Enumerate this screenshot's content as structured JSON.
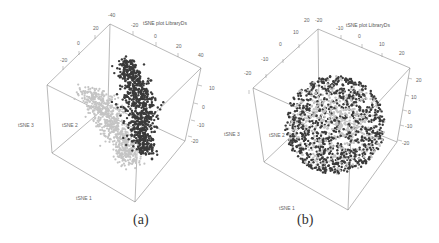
{
  "chart_data": [
    {
      "type": "scatter",
      "subtype": "3d-scatter",
      "panel": "(a)",
      "title": "tSNE plot LibraryDs",
      "axes": {
        "x": {
          "label": "tSNE 1",
          "ticks": []
        },
        "y": {
          "label": "tSNE 2",
          "ticks": []
        },
        "z": {
          "label": "tSNE 3",
          "ticks": [
            "10",
            "0",
            "-10",
            "-20"
          ]
        },
        "top_edge_ticks": [
          "-20",
          "0",
          "20",
          "40"
        ],
        "left_edge_ticks": [
          "-20",
          "0",
          "20",
          "40"
        ]
      },
      "series": [
        {
          "name": "cluster-light",
          "color": "#c4c4c4",
          "description": "elongated curved cluster on left side"
        },
        {
          "name": "cluster-dark",
          "color": "#3a3a3a",
          "description": "tall vertical band cluster on right side"
        }
      ],
      "grid": false,
      "legend": "none"
    },
    {
      "type": "scatter",
      "subtype": "3d-scatter",
      "panel": "(b)",
      "title": "tSNE plot LibraryDs",
      "axes": {
        "x": {
          "label": "tSNE 1",
          "ticks": []
        },
        "y": {
          "label": "tSNE 2",
          "ticks": []
        },
        "z": {
          "label": "tSNE 3",
          "ticks": [
            "20",
            "10",
            "0",
            "-10",
            "-20"
          ]
        },
        "top_edge_ticks": [
          "-20",
          "-10",
          "0",
          "10",
          "20"
        ],
        "left_edge_ticks": [
          "-20",
          "-10",
          "0",
          "10",
          "20"
        ]
      },
      "series": [
        {
          "name": "points-light",
          "color": "#c4c4c4",
          "description": "mixed within a spherical blob"
        },
        {
          "name": "points-dark",
          "color": "#3a3a3a",
          "description": "mixed within a spherical blob"
        }
      ],
      "grid": false,
      "legend": "none"
    }
  ],
  "panels": {
    "a": {
      "caption": "(a)",
      "title": "tSNE plot LibraryDs",
      "label_x": "tSNE 1",
      "label_y": "tSNE 2",
      "label_z": "tSNE 3",
      "left_ticks": [
        "-20",
        "0",
        "20"
      ],
      "top_corner_tick": "-40",
      "top_ticks": [
        "-20",
        "0",
        "20"
      ],
      "top_right_tick": "40",
      "right_ticks": [
        "10",
        "0",
        "-10",
        "-20"
      ]
    },
    "b": {
      "caption": "(b)",
      "title": "tSNE plot LibraryDs",
      "label_x": "tSNE 1",
      "label_y": "tSNE 2",
      "label_z": "tSNE 3",
      "left_ticks": [
        "-20",
        "-10",
        "0",
        "10"
      ],
      "top_corner_ticks": [
        "20",
        "-20"
      ],
      "top_ticks": [
        "-10",
        "0",
        "10"
      ],
      "top_right_tick": "20",
      "right_ticks": [
        "20",
        "10",
        "0",
        "-10",
        "-20"
      ]
    }
  },
  "colors": {
    "light_points": "#c4c4c4",
    "dark_points": "#3a3a3a",
    "box_lines": "#8a8a8a"
  }
}
